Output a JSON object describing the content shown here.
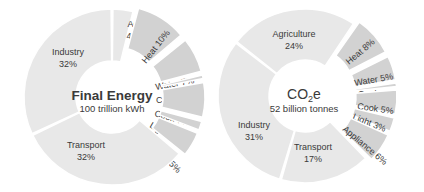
{
  "chart_data": [
    {
      "type": "pie",
      "variant": "donut",
      "title": "Final Energy",
      "subtitle": "100 trillion kWh",
      "start_angle_deg": 0,
      "direction": "clockwise",
      "categories": [
        "Ag",
        "Heat",
        "Water",
        "Cool",
        "Cook",
        "Light",
        "Appliance",
        "Transport",
        "Industry"
      ],
      "values": [
        4,
        10,
        7,
        1,
        7,
        2,
        5,
        32,
        32
      ],
      "unit": "%",
      "exploded": [
        "Heat",
        "Water",
        "Cool",
        "Cook",
        "Light",
        "Appliance"
      ],
      "labels": [
        "Ag\n4%",
        "Heat 10%",
        "Water 7%",
        "Cool 1%",
        "Cook 7%",
        "Light 2%",
        "Appliance 5%",
        "Transport\n32%",
        "Industry\n32%"
      ]
    },
    {
      "type": "pie",
      "variant": "donut",
      "title": "CO₂e",
      "subtitle": "52 billion tonnes",
      "start_angle_deg": -52,
      "direction": "clockwise",
      "categories": [
        "Agriculture",
        "Heat",
        "Water",
        "Cool",
        "Cook",
        "Light",
        "Appliance",
        "Transport",
        "Industry"
      ],
      "values": [
        24,
        8,
        5,
        1,
        5,
        3,
        6,
        17,
        31
      ],
      "unit": "%",
      "exploded": [
        "Heat",
        "Water",
        "Cool",
        "Cook",
        "Light",
        "Appliance"
      ],
      "labels": [
        "Agriculture\n24%",
        "Heat 8%",
        "Water 5%",
        "Cool 1%",
        "Cook 5%",
        "Light 3%",
        "Appliance 6%",
        "Transport\n17%",
        "Industry\n31%"
      ]
    }
  ],
  "colors": {
    "main_slice": "#e8e8e8",
    "building_slice": "#d2d2d2",
    "separator": "#ffffff",
    "text": "#3a3a3a"
  },
  "left": {
    "center_title": "Final Energy",
    "center_subtitle": "100 trillion kWh"
  },
  "right": {
    "center_title_main": "CO",
    "center_title_sub": "2",
    "center_title_tail": "e",
    "center_subtitle": "52 billion tonnes"
  }
}
